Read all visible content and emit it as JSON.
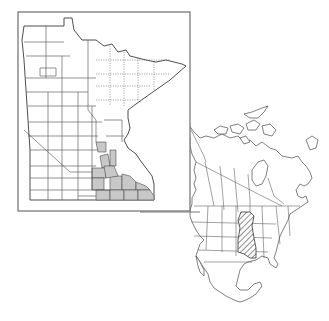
{
  "figure": {
    "type": "species-distribution-map",
    "background_color": "#ffffff",
    "line_color": "#4a4a4a",
    "minnesota_map": {
      "region": "Minnesota",
      "subdivision": "counties",
      "frame_box": {
        "x": 18,
        "y": 12,
        "width": 172,
        "height": 199
      },
      "shaded_fill_color": "#c8c8c8",
      "shaded_region_description": "Counties in east-central and southeastern Minnesota (Twin Cities metro area and southeast)",
      "legend": ""
    },
    "north_america_inset": {
      "region": "North America",
      "subdivision": "states and provinces",
      "range_fill": "diagonal hatching",
      "range_color": "#333333",
      "range_description": "Hatched range across the central-eastern United States (upper Midwest south toward the Gulf states)"
    },
    "connector": {
      "from": "Minnesota map frame",
      "to": "North America inset"
    }
  }
}
